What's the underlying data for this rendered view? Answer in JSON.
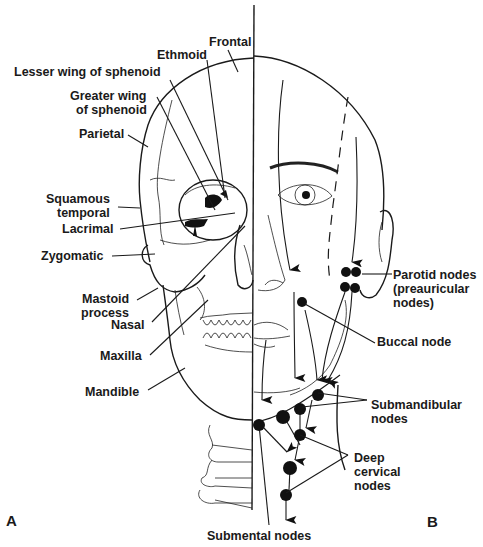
{
  "figure": {
    "panel_a_label": "A",
    "panel_b_label": "B",
    "panel_a_description": "Skull bones, right half of face (left side of figure)",
    "panel_b_description": "Lymphatic drainage of face and head (right side of figure)"
  },
  "bone_labels": [
    {
      "id": "frontal",
      "text": "Frontal"
    },
    {
      "id": "ethmoid",
      "text": "Ethmoid"
    },
    {
      "id": "lesser-wing",
      "text": "Lesser wing of sphenoid"
    },
    {
      "id": "greater-wing-1",
      "text": "Greater wing"
    },
    {
      "id": "greater-wing-2",
      "text": "of sphenoid"
    },
    {
      "id": "parietal",
      "text": "Parietal"
    },
    {
      "id": "squamous-1",
      "text": "Squamous"
    },
    {
      "id": "squamous-2",
      "text": "temporal"
    },
    {
      "id": "lacrimal",
      "text": "Lacrimal"
    },
    {
      "id": "zygomatic",
      "text": "Zygomatic"
    },
    {
      "id": "mastoid-1",
      "text": "Mastoid"
    },
    {
      "id": "mastoid-2",
      "text": "process"
    },
    {
      "id": "nasal",
      "text": "Nasal"
    },
    {
      "id": "maxilla",
      "text": "Maxilla"
    },
    {
      "id": "mandible",
      "text": "Mandible"
    }
  ],
  "node_labels": [
    {
      "id": "parotid-1",
      "text": "Parotid nodes"
    },
    {
      "id": "parotid-2",
      "text": "(preauricular"
    },
    {
      "id": "parotid-3",
      "text": "nodes)"
    },
    {
      "id": "buccal",
      "text": "Buccal node"
    },
    {
      "id": "submandibular-1",
      "text": "Submandibular"
    },
    {
      "id": "submandibular-2",
      "text": "nodes"
    },
    {
      "id": "deep-cervical-1",
      "text": "Deep"
    },
    {
      "id": "deep-cervical-2",
      "text": "cervical"
    },
    {
      "id": "deep-cervical-3",
      "text": "nodes"
    },
    {
      "id": "submental",
      "text": "Submental nodes"
    }
  ],
  "colors": {
    "ink": "#1a1a1a",
    "background": "#ffffff"
  }
}
